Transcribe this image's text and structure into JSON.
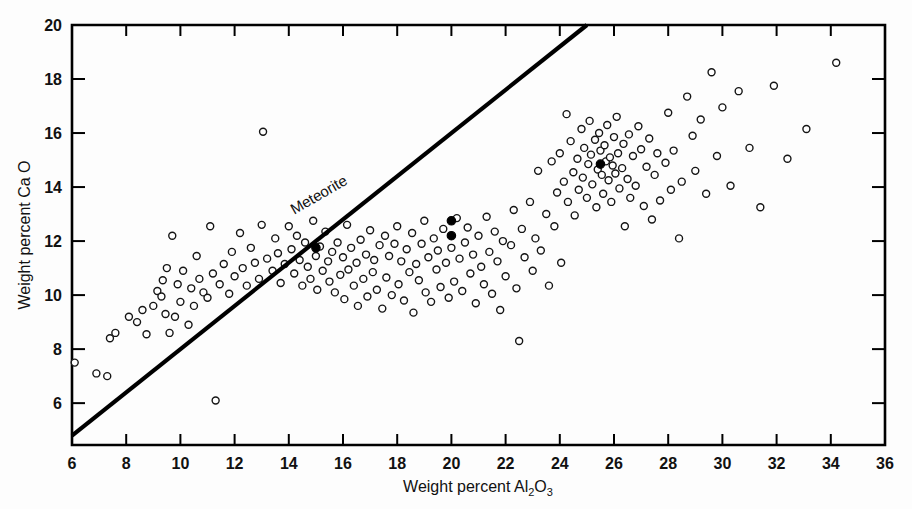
{
  "figure": {
    "title": "",
    "background_color": "#fdfdfd",
    "ink_color": "#000000"
  },
  "axes": {
    "x": {
      "label_prefix": "Weight percent Al",
      "label_sub1": "2",
      "label_mid": "O",
      "label_sub2": "3",
      "label_plain": "Weight percent Al2O3",
      "ticks": [
        6,
        8,
        10,
        12,
        14,
        16,
        18,
        20,
        22,
        24,
        26,
        28,
        30,
        32,
        34,
        36
      ],
      "min": 6,
      "max": 36
    },
    "y": {
      "label": "Weight percent Ca O",
      "ticks": [
        6,
        8,
        10,
        12,
        14,
        16,
        18,
        20
      ],
      "min": 4.45,
      "max": 20
    }
  },
  "annotations": [
    {
      "name": "meteorite-trend-label",
      "text": "Meteorite",
      "x": 15.2,
      "y": 13.55,
      "rotation": -30
    }
  ],
  "chart_data": {
    "type": "scatter",
    "title": "",
    "xlabel": "Weight percent Al2O3",
    "ylabel": "Weight percent Ca O",
    "xlim": [
      6,
      36
    ],
    "ylim": [
      4.45,
      20
    ],
    "grid": false,
    "legend": null,
    "reference_line": {
      "name": "Meteorite",
      "label": "Meteorite",
      "style": "solid",
      "width_px": 4.2,
      "x0": 6.0,
      "y0": 4.8,
      "x1": 25.0,
      "y1": 20.0,
      "slope": 0.8,
      "intercept": 0.0
    },
    "series": [
      {
        "name": "open-circles",
        "marker": "o",
        "fill": "none",
        "edge_color": "#151515",
        "size_px": 7,
        "points": [
          [
            6.1,
            7.5
          ],
          [
            6.9,
            7.1
          ],
          [
            7.3,
            7.0
          ],
          [
            7.4,
            8.4
          ],
          [
            7.6,
            8.6
          ],
          [
            8.1,
            9.2
          ],
          [
            8.4,
            9.0
          ],
          [
            8.6,
            9.45
          ],
          [
            8.75,
            8.55
          ],
          [
            9.0,
            9.6
          ],
          [
            9.15,
            10.15
          ],
          [
            9.3,
            9.95
          ],
          [
            9.35,
            10.55
          ],
          [
            9.45,
            9.3
          ],
          [
            9.5,
            11.0
          ],
          [
            9.6,
            8.6
          ],
          [
            9.7,
            12.2
          ],
          [
            9.8,
            9.2
          ],
          [
            9.9,
            10.4
          ],
          [
            10.0,
            9.75
          ],
          [
            10.1,
            10.9
          ],
          [
            10.3,
            8.9
          ],
          [
            10.4,
            10.25
          ],
          [
            10.5,
            9.6
          ],
          [
            10.6,
            11.45
          ],
          [
            10.7,
            10.6
          ],
          [
            10.85,
            10.1
          ],
          [
            11.0,
            9.9
          ],
          [
            11.1,
            12.55
          ],
          [
            11.2,
            10.8
          ],
          [
            11.3,
            6.1
          ],
          [
            11.45,
            10.4
          ],
          [
            11.6,
            11.15
          ],
          [
            11.8,
            10.05
          ],
          [
            11.9,
            11.6
          ],
          [
            12.0,
            10.7
          ],
          [
            12.2,
            12.3
          ],
          [
            12.3,
            11.0
          ],
          [
            12.45,
            10.35
          ],
          [
            12.6,
            11.75
          ],
          [
            12.75,
            11.2
          ],
          [
            12.9,
            10.6
          ],
          [
            13.0,
            12.6
          ],
          [
            13.05,
            16.05
          ],
          [
            13.2,
            11.35
          ],
          [
            13.4,
            10.9
          ],
          [
            13.5,
            12.1
          ],
          [
            13.6,
            11.55
          ],
          [
            13.7,
            10.45
          ],
          [
            13.85,
            11.15
          ],
          [
            14.0,
            12.55
          ],
          [
            14.1,
            11.7
          ],
          [
            14.2,
            10.8
          ],
          [
            14.3,
            12.2
          ],
          [
            14.4,
            11.3
          ],
          [
            14.5,
            10.35
          ],
          [
            14.6,
            11.95
          ],
          [
            14.7,
            11.05
          ],
          [
            14.8,
            10.6
          ],
          [
            14.9,
            12.75
          ],
          [
            15.0,
            11.45
          ],
          [
            15.05,
            10.2
          ],
          [
            15.15,
            11.8
          ],
          [
            15.25,
            10.9
          ],
          [
            15.35,
            12.35
          ],
          [
            15.45,
            11.25
          ],
          [
            15.5,
            10.5
          ],
          [
            15.6,
            11.6
          ],
          [
            15.7,
            10.1
          ],
          [
            15.8,
            11.95
          ],
          [
            15.9,
            10.75
          ],
          [
            16.0,
            11.4
          ],
          [
            16.05,
            9.85
          ],
          [
            16.15,
            12.6
          ],
          [
            16.2,
            10.95
          ],
          [
            16.3,
            11.75
          ],
          [
            16.4,
            10.35
          ],
          [
            16.5,
            11.2
          ],
          [
            16.55,
            9.6
          ],
          [
            16.65,
            12.05
          ],
          [
            16.75,
            10.6
          ],
          [
            16.85,
            11.5
          ],
          [
            16.9,
            9.95
          ],
          [
            17.0,
            12.4
          ],
          [
            17.1,
            10.85
          ],
          [
            17.15,
            11.3
          ],
          [
            17.25,
            10.2
          ],
          [
            17.35,
            11.85
          ],
          [
            17.45,
            9.5
          ],
          [
            17.55,
            12.2
          ],
          [
            17.6,
            10.65
          ],
          [
            17.7,
            11.45
          ],
          [
            17.8,
            10.0
          ],
          [
            17.9,
            11.9
          ],
          [
            18.0,
            12.55
          ],
          [
            18.05,
            10.4
          ],
          [
            18.15,
            11.25
          ],
          [
            18.25,
            9.8
          ],
          [
            18.35,
            11.7
          ],
          [
            18.45,
            10.85
          ],
          [
            18.55,
            12.3
          ],
          [
            18.6,
            9.35
          ],
          [
            18.7,
            11.15
          ],
          [
            18.8,
            10.55
          ],
          [
            18.9,
            11.9
          ],
          [
            19.0,
            12.75
          ],
          [
            19.05,
            10.1
          ],
          [
            19.15,
            11.4
          ],
          [
            19.25,
            9.75
          ],
          [
            19.35,
            12.1
          ],
          [
            19.45,
            10.95
          ],
          [
            19.5,
            11.65
          ],
          [
            19.6,
            10.3
          ],
          [
            19.7,
            12.45
          ],
          [
            19.8,
            11.2
          ],
          [
            19.9,
            9.9
          ],
          [
            20.0,
            11.75
          ],
          [
            20.1,
            10.5
          ],
          [
            20.2,
            12.85
          ],
          [
            20.3,
            11.35
          ],
          [
            20.4,
            10.15
          ],
          [
            20.5,
            11.95
          ],
          [
            20.6,
            12.5
          ],
          [
            20.7,
            10.8
          ],
          [
            20.8,
            11.5
          ],
          [
            20.9,
            9.7
          ],
          [
            21.0,
            12.2
          ],
          [
            21.1,
            11.05
          ],
          [
            21.2,
            10.4
          ],
          [
            21.3,
            12.9
          ],
          [
            21.4,
            11.6
          ],
          [
            21.5,
            10.05
          ],
          [
            21.6,
            12.35
          ],
          [
            21.7,
            11.25
          ],
          [
            21.8,
            9.45
          ],
          [
            21.9,
            12.0
          ],
          [
            22.0,
            10.7
          ],
          [
            22.2,
            11.85
          ],
          [
            22.3,
            13.15
          ],
          [
            22.4,
            10.25
          ],
          [
            22.5,
            8.3
          ],
          [
            22.6,
            12.45
          ],
          [
            22.7,
            11.4
          ],
          [
            22.9,
            13.45
          ],
          [
            23.0,
            10.9
          ],
          [
            23.1,
            12.1
          ],
          [
            23.2,
            14.6
          ],
          [
            23.3,
            11.65
          ],
          [
            23.5,
            13.0
          ],
          [
            23.6,
            10.35
          ],
          [
            23.7,
            14.95
          ],
          [
            23.8,
            12.55
          ],
          [
            23.9,
            13.8
          ],
          [
            24.0,
            15.25
          ],
          [
            24.05,
            11.2
          ],
          [
            24.15,
            14.2
          ],
          [
            24.25,
            16.7
          ],
          [
            24.3,
            13.45
          ],
          [
            24.4,
            15.7
          ],
          [
            24.5,
            14.55
          ],
          [
            24.55,
            12.95
          ],
          [
            24.65,
            15.05
          ],
          [
            24.7,
            13.9
          ],
          [
            24.8,
            16.15
          ],
          [
            24.85,
            14.35
          ],
          [
            24.9,
            15.45
          ],
          [
            25.0,
            13.6
          ],
          [
            25.05,
            14.85
          ],
          [
            25.1,
            16.45
          ],
          [
            25.15,
            15.2
          ],
          [
            25.2,
            14.1
          ],
          [
            25.3,
            15.75
          ],
          [
            25.35,
            13.25
          ],
          [
            25.4,
            14.65
          ],
          [
            25.45,
            16.0
          ],
          [
            25.5,
            15.35
          ],
          [
            25.55,
            14.45
          ],
          [
            25.6,
            13.75
          ],
          [
            25.65,
            15.55
          ],
          [
            25.7,
            14.95
          ],
          [
            25.75,
            16.3
          ],
          [
            25.8,
            14.25
          ],
          [
            25.85,
            15.1
          ],
          [
            25.9,
            13.45
          ],
          [
            25.95,
            14.8
          ],
          [
            26.0,
            15.85
          ],
          [
            26.05,
            14.5
          ],
          [
            26.1,
            16.6
          ],
          [
            26.15,
            15.25
          ],
          [
            26.2,
            13.95
          ],
          [
            26.3,
            14.7
          ],
          [
            26.35,
            15.6
          ],
          [
            26.4,
            12.55
          ],
          [
            26.5,
            14.3
          ],
          [
            26.55,
            15.95
          ],
          [
            26.6,
            13.6
          ],
          [
            26.7,
            15.15
          ],
          [
            26.8,
            14.05
          ],
          [
            26.9,
            16.25
          ],
          [
            27.0,
            15.4
          ],
          [
            27.1,
            13.3
          ],
          [
            27.2,
            14.75
          ],
          [
            27.3,
            15.8
          ],
          [
            27.4,
            12.8
          ],
          [
            27.5,
            14.45
          ],
          [
            27.6,
            15.25
          ],
          [
            27.7,
            13.5
          ],
          [
            27.9,
            14.9
          ],
          [
            28.0,
            16.75
          ],
          [
            28.1,
            13.9
          ],
          [
            28.2,
            15.35
          ],
          [
            28.4,
            12.1
          ],
          [
            28.5,
            14.2
          ],
          [
            28.7,
            17.35
          ],
          [
            28.9,
            15.9
          ],
          [
            29.0,
            14.6
          ],
          [
            29.2,
            16.5
          ],
          [
            29.4,
            13.75
          ],
          [
            29.6,
            18.25
          ],
          [
            29.8,
            15.15
          ],
          [
            30.0,
            16.95
          ],
          [
            30.3,
            14.05
          ],
          [
            30.6,
            17.55
          ],
          [
            31.0,
            15.45
          ],
          [
            31.4,
            13.25
          ],
          [
            31.9,
            17.75
          ],
          [
            32.4,
            15.05
          ],
          [
            33.1,
            16.15
          ],
          [
            34.2,
            18.6
          ]
        ]
      },
      {
        "name": "filled-circles",
        "marker": "o",
        "fill": "#000000",
        "edge_color": "#000000",
        "size_px": 7,
        "points": [
          [
            15.0,
            11.75
          ],
          [
            20.0,
            12.75
          ],
          [
            20.0,
            12.2
          ],
          [
            25.5,
            14.85
          ]
        ]
      }
    ]
  }
}
